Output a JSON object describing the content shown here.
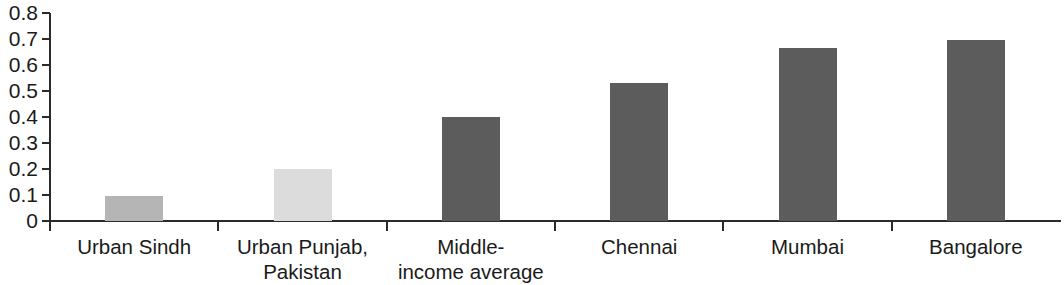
{
  "chart_data": {
    "type": "bar",
    "title": "",
    "subtitle": "",
    "xlabel": "",
    "ylabel": "",
    "categories": [
      "Urban Sindh",
      "Urban Punjab,\nPakistan",
      "Middle-\nincome average",
      "Chennai",
      "Mumbai",
      "Bangalore"
    ],
    "category_lines": [
      [
        "Urban Sindh"
      ],
      [
        "Urban Punjab,",
        "Pakistan"
      ],
      [
        "Middle-",
        "income average"
      ],
      [
        "Chennai"
      ],
      [
        "Mumbai"
      ],
      [
        "Bangalore"
      ]
    ],
    "values": [
      0.095,
      0.2,
      0.4,
      0.53,
      0.665,
      0.695
    ],
    "bar_colors": [
      "#b5b5b5",
      "#dcdcdc",
      "#5c5c5c",
      "#5c5c5c",
      "#5c5c5c",
      "#5c5c5c"
    ],
    "ylim": [
      0,
      0.8
    ],
    "ytick_values": [
      0,
      0.1,
      0.2,
      0.3,
      0.4,
      0.5,
      0.6,
      0.7,
      0.8
    ],
    "ytick_labels": [
      "0",
      "0.1",
      "0.2",
      "0.3",
      "0.4",
      "0.5",
      "0.6",
      "0.7",
      "0.8"
    ],
    "grid": false,
    "legend": "none",
    "axis_color": "#2b2b2b",
    "background": "#ffffff"
  },
  "axis": {
    "y_labels": [
      "0.8",
      "0.7",
      "0.6",
      "0.5",
      "0.4",
      "0.3",
      "0.2",
      "0.1",
      "0"
    ]
  },
  "bars": [
    {
      "label_line1": "Urban Sindh",
      "label_line2": "",
      "value": 0.095,
      "color": "#b5b5b5"
    },
    {
      "label_line1": "Urban Punjab,",
      "label_line2": "Pakistan",
      "value": 0.2,
      "color": "#dcdcdc"
    },
    {
      "label_line1": "Middle-",
      "label_line2": "income average",
      "value": 0.4,
      "color": "#5c5c5c"
    },
    {
      "label_line1": "Chennai",
      "label_line2": "",
      "value": 0.53,
      "color": "#5c5c5c"
    },
    {
      "label_line1": "Mumbai",
      "label_line2": "",
      "value": 0.665,
      "color": "#5c5c5c"
    },
    {
      "label_line1": "Bangalore",
      "label_line2": "",
      "value": 0.695,
      "color": "#5c5c5c"
    }
  ]
}
